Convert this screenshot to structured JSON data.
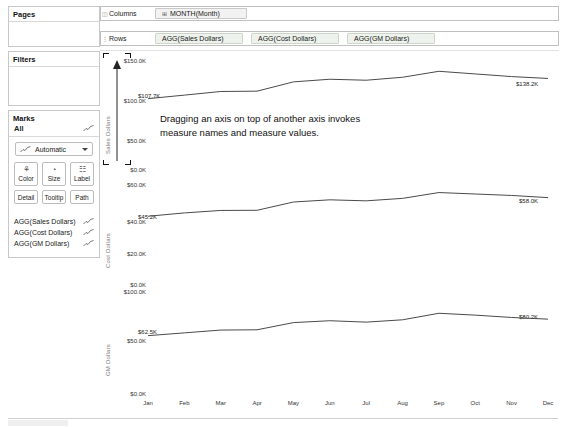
{
  "sidebar": {
    "pages": {
      "title": "Pages"
    },
    "filters": {
      "title": "Filters"
    },
    "marks": {
      "title": "Marks",
      "all_label": "All",
      "mark_type": "Automatic",
      "buttons": [
        {
          "name": "color",
          "label": "Color",
          "glyph": "⚘"
        },
        {
          "name": "size",
          "label": "Size",
          "glyph": "◔"
        },
        {
          "name": "label",
          "label": "Label",
          "glyph": "☷"
        },
        {
          "name": "detail",
          "label": "Detail"
        },
        {
          "name": "tooltip",
          "label": "Tooltip"
        },
        {
          "name": "path",
          "label": "Path"
        }
      ],
      "fields": [
        {
          "label": "AGG(Sales Dollars)",
          "icon": "line-chart-icon"
        },
        {
          "label": "AGG(Cost Dollars)",
          "icon": "line-chart-icon"
        },
        {
          "label": "AGG(GM Dollars)",
          "icon": "line-chart-icon"
        }
      ]
    }
  },
  "shelves": {
    "columns": {
      "label": "Columns",
      "pills": [
        {
          "text": "MONTH(Month)",
          "prefix": "⊞"
        }
      ]
    },
    "rows": {
      "label": "Rows",
      "pills": [
        {
          "text": "AGG(Sales Dollars)"
        },
        {
          "text": "AGG(Cost Dollars)"
        },
        {
          "text": "AGG(GM Dollars)"
        }
      ]
    }
  },
  "annotation": {
    "text": "Dragging an axis on top of another axis invokes measure names and measure values."
  },
  "drop_target": {
    "name": "axis-drop-target",
    "arrow": "up"
  },
  "chart_data": {
    "type": "line",
    "title": "",
    "xlabel": "",
    "grid": false,
    "legend": false,
    "categories": [
      "Jan",
      "Feb",
      "Mar",
      "Apr",
      "May",
      "Jun",
      "Jul",
      "Aug",
      "Sep",
      "Oct",
      "Nov",
      "Dec"
    ],
    "panels": [
      {
        "ylabel": "Sales Dollars",
        "yticks": [
          "$150.0K",
          "$100.0K",
          "$50.0K",
          "$0.0K"
        ],
        "ytickvals": [
          150000,
          100000,
          50000,
          0
        ],
        "ylim": [
          0,
          160000
        ],
        "series": [
          {
            "name": "AGG(Sales Dollars)",
            "values": [
              107700,
              113000,
              118500,
              119000,
              133000,
              137000,
              135500,
              140000,
              149000,
              145000,
              141000,
              138200
            ],
            "start_label": "$107.7K",
            "end_label": "$138.2K"
          }
        ]
      },
      {
        "ylabel": "Cost Dollars",
        "yticks": [
          "$60.0K",
          "$40.0K",
          "$20.0K",
          "$0.0K"
        ],
        "ytickvals": [
          60000,
          40000,
          20000,
          0
        ],
        "ylim": [
          0,
          66000
        ],
        "series": [
          {
            "name": "AGG(Cost Dollars)",
            "values": [
              45200,
              47500,
              49200,
              49300,
              55000,
              56500,
              55800,
              57500,
              61500,
              60500,
              59500,
              58000
            ],
            "start_label": "$45.2K",
            "end_label": "$58.0K"
          }
        ]
      },
      {
        "ylabel": "GM Dollars",
        "yticks": [
          "$100.0K",
          "$50.0K",
          "$0.0K"
        ],
        "ytickvals": [
          100000,
          50000,
          0
        ],
        "ylim": [
          0,
          105000
        ],
        "series": [
          {
            "name": "AGG(GM Dollars)",
            "values": [
              62500,
              65500,
              68500,
              68800,
              76500,
              78500,
              77000,
              79500,
              86500,
              84500,
              82000,
              80200
            ],
            "start_label": "$62.5K",
            "end_label": "$80.2K"
          }
        ]
      }
    ]
  }
}
